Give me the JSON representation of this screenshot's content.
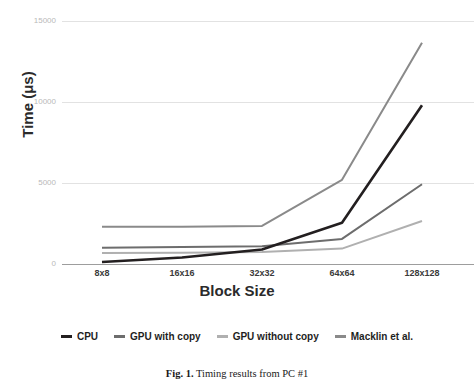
{
  "figure": {
    "caption_number": "Fig. 1.",
    "caption_text": "Timing results from PC #1",
    "title_sliver": ""
  },
  "chart_data": {
    "type": "line",
    "title": "",
    "xlabel": "Block Size",
    "ylabel": "Time (μs)",
    "categories": [
      "8x8",
      "16x16",
      "32x32",
      "64x64",
      "128x128"
    ],
    "ylim": [
      0,
      15000
    ],
    "yticks": [
      0,
      5000,
      10000,
      15000
    ],
    "ytick_labels": [
      "0",
      "5000",
      "10000",
      "15000"
    ],
    "grid": true,
    "legend_position": "bottom",
    "series": [
      {
        "name": "CPU",
        "color": "#231f20",
        "values": [
          120,
          400,
          900,
          2550,
          9800
        ]
      },
      {
        "name": "GPU with copy",
        "color": "#6d6d6d",
        "values": [
          1000,
          1050,
          1100,
          1550,
          4920
        ]
      },
      {
        "name": "GPU without copy",
        "color": "#b0b0b0",
        "values": [
          680,
          700,
          740,
          950,
          2650
        ]
      },
      {
        "name": "Macklin et al.",
        "color": "#8a8a8a",
        "values": [
          2300,
          2300,
          2350,
          5200,
          13650
        ]
      }
    ]
  },
  "legend": {
    "items": [
      {
        "label": "CPU",
        "color": "#231f20"
      },
      {
        "label": "GPU with copy",
        "color": "#6d6d6d"
      },
      {
        "label": "GPU without copy",
        "color": "#b0b0b0"
      },
      {
        "label": "Macklin et al.",
        "color": "#8a8a8a"
      }
    ]
  }
}
